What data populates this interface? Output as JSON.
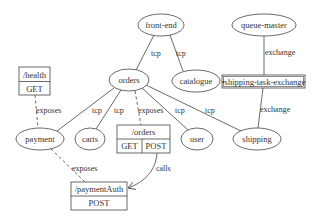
{
  "diagram": {
    "colors": {
      "stroke": "#444444",
      "text": "#333333",
      "background": "#ffffff"
    },
    "nodes": {
      "front_end": {
        "label": "front-end",
        "shape": "ellipse"
      },
      "catalogue": {
        "label": "catalogue",
        "shape": "ellipse"
      },
      "orders": {
        "label": "orders",
        "shape": "ellipse"
      },
      "queue_master": {
        "label": "queue-master",
        "shape": "ellipse"
      },
      "shipping_task_exchange": {
        "label": "•shipping-task-exchange",
        "shape": "box"
      },
      "health": {
        "label": "/health",
        "method": "GET",
        "shape": "record"
      },
      "payment": {
        "label": "payment",
        "shape": "ellipse"
      },
      "carts": {
        "label": "carts",
        "shape": "ellipse"
      },
      "orders_endpoint": {
        "label": "/orders",
        "methods": [
          "GET",
          "POST"
        ],
        "shape": "record"
      },
      "user": {
        "label": "user",
        "shape": "ellipse"
      },
      "shipping": {
        "label": "shipping",
        "shape": "ellipse"
      },
      "payment_auth": {
        "label": "/paymentAuth",
        "method": "POST",
        "shape": "record"
      }
    },
    "edges": {
      "frontend_orders": {
        "from": "front-end",
        "to": "orders",
        "label": "tcp",
        "style": "solid"
      },
      "frontend_catalogue": {
        "from": "front-end",
        "to": "catalogue",
        "label": "tcp",
        "style": "solid"
      },
      "queuemaster_exchange": {
        "from": "queue-master",
        "to": "shipping-task-exchange",
        "label": "exchange",
        "style": "solid"
      },
      "exchange_shipping": {
        "from": "shipping-task-exchange",
        "to": "shipping",
        "label": "exchange",
        "style": "solid"
      },
      "health_payment": {
        "from": "/health",
        "to": "payment",
        "label": "exposes",
        "style": "dashed"
      },
      "orders_payment": {
        "from": "orders",
        "to": "payment",
        "label": "tcp",
        "style": "solid"
      },
      "orders_carts": {
        "from": "orders",
        "to": "carts",
        "label": "tcp",
        "style": "solid"
      },
      "orders_endpoint": {
        "from": "orders",
        "to": "/orders",
        "label": "exposes",
        "style": "dashed"
      },
      "orders_user": {
        "from": "orders",
        "to": "user",
        "label": "tcp",
        "style": "solid"
      },
      "orders_shipping": {
        "from": "orders",
        "to": "shipping",
        "label": "tcp",
        "style": "solid"
      },
      "payment_paymentauth": {
        "from": "payment",
        "to": "/paymentAuth",
        "label": "exposes",
        "style": "dashed"
      },
      "ordersendpoint_paymentauth": {
        "from": "/orders POST",
        "to": "/paymentAuth",
        "label": "calls",
        "style": "solid-arrow"
      }
    }
  }
}
